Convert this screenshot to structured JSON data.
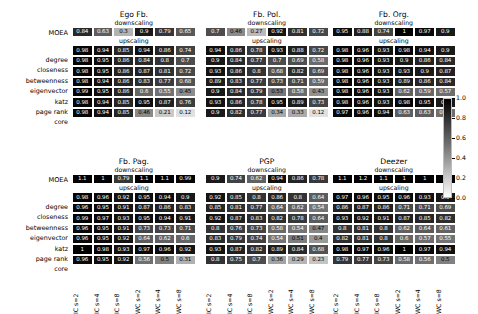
{
  "figure": {
    "cell_labels": {
      "downscaling": "downscaling",
      "upscaling": "upscaling",
      "moea_row_label": "MOEA"
    },
    "row_labels": [
      "degree",
      "closeness",
      "betweenness",
      "eigenvector",
      "katz",
      "page rank",
      "core"
    ],
    "column_labels": [
      "IC s=2",
      "IC s=4",
      "IC s=8",
      "WC s=2",
      "WC s=4",
      "WC s=8"
    ],
    "colorbar": {
      "ticks": [
        "1.0",
        "0.8",
        "0.6",
        "0.4",
        "0.2",
        "0.0"
      ],
      "vmin": 0.0,
      "vmax": 1.0,
      "colormap": "greys_reversed",
      "high_color": "#000000",
      "low_color": "#ffffff"
    }
  },
  "chart_data": {
    "type": "heatmap",
    "title": "",
    "xlabel": "",
    "ylabel": "",
    "colorbar_range": [
      0.0,
      1.0
    ],
    "x_categories": [
      "IC s=2",
      "IC s=4",
      "IC s=8",
      "WC s=2",
      "WC s=4",
      "WC s=8"
    ],
    "y_categories_main": [
      "degree",
      "closeness",
      "betweenness",
      "eigenvector",
      "katz",
      "page rank",
      "core"
    ],
    "y_categories_moea": [
      "MOEA"
    ],
    "panels": [
      {
        "name": "Ego Fb.",
        "row": 0,
        "col": 0,
        "downscaling_label": "downscaling",
        "upscaling_label": "upscaling",
        "moea": [
          0.84,
          0.63,
          0.3,
          0.9,
          0.79,
          0.65
        ],
        "values": [
          [
            0.98,
            0.94,
            0.85,
            0.94,
            0.86,
            0.74
          ],
          [
            0.98,
            0.95,
            0.86,
            0.84,
            0.8,
            0.7
          ],
          [
            0.98,
            0.95,
            0.86,
            0.87,
            0.81,
            0.72
          ],
          [
            0.98,
            0.94,
            0.86,
            0.83,
            0.77,
            0.68
          ],
          [
            0.99,
            0.95,
            0.86,
            0.6,
            0.55,
            0.45
          ],
          [
            0.98,
            0.94,
            0.85,
            0.95,
            0.87,
            0.76
          ],
          [
            0.98,
            0.94,
            0.85,
            0.46,
            0.21,
            0.12
          ]
        ]
      },
      {
        "name": "Fb. Pol.",
        "row": 0,
        "col": 1,
        "downscaling_label": "downscaling",
        "upscaling_label": "upscaling",
        "moea": [
          0.7,
          0.46,
          0.27,
          0.92,
          0.81,
          0.72
        ],
        "values": [
          [
            0.94,
            0.86,
            0.78,
            0.93,
            0.88,
            0.72
          ],
          [
            0.9,
            0.84,
            0.77,
            0.7,
            0.69,
            0.58
          ],
          [
            0.93,
            0.86,
            0.8,
            0.68,
            0.82,
            0.69
          ],
          [
            0.89,
            0.83,
            0.77,
            0.73,
            0.71,
            0.59
          ],
          [
            0.9,
            0.84,
            0.79,
            0.53,
            0.58,
            0.43
          ],
          [
            0.93,
            0.86,
            0.78,
            0.95,
            0.89,
            0.73
          ],
          [
            0.9,
            0.82,
            0.77,
            0.34,
            0.33,
            0.12
          ]
        ]
      },
      {
        "name": "Fb. Org.",
        "row": 0,
        "col": 2,
        "downscaling_label": "downscaling",
        "upscaling_label": "upscaling",
        "moea": [
          0.95,
          0.88,
          0.74,
          1.0,
          0.97,
          0.9
        ],
        "values": [
          [
            0.98,
            0.96,
            0.93,
            0.98,
            0.94,
            0.9
          ],
          [
            0.98,
            0.96,
            0.93,
            0.9,
            0.86,
            0.84
          ],
          [
            0.98,
            0.96,
            0.93,
            0.93,
            0.9,
            0.87
          ],
          [
            0.98,
            0.96,
            0.93,
            0.89,
            0.86,
            0.84
          ],
          [
            0.98,
            0.96,
            0.93,
            0.62,
            0.59,
            0.57
          ],
          [
            0.98,
            0.96,
            0.93,
            0.98,
            0.95,
            0.9
          ],
          [
            0.97,
            0.96,
            0.94,
            0.63,
            0.63,
            0.56
          ]
        ]
      },
      {
        "name": "Fb. Pag.",
        "row": 1,
        "col": 0,
        "downscaling_label": "downscaling",
        "upscaling_label": "upscaling",
        "moea": [
          1.1,
          1.0,
          0.79,
          1.1,
          1.1,
          0.99
        ],
        "values": [
          [
            0.98,
            0.96,
            0.92,
            0.95,
            0.94,
            0.9
          ],
          [
            0.96,
            0.95,
            0.91,
            0.87,
            0.86,
            0.83
          ],
          [
            0.99,
            0.97,
            0.93,
            0.95,
            0.94,
            0.91
          ],
          [
            0.96,
            0.95,
            0.91,
            0.73,
            0.73,
            0.71
          ],
          [
            0.96,
            0.95,
            0.92,
            0.64,
            0.62,
            0.6
          ],
          [
            1.0,
            0.98,
            0.93,
            0.97,
            0.96,
            0.92
          ],
          [
            0.96,
            0.95,
            0.92,
            0.56,
            0.5,
            0.31
          ]
        ]
      },
      {
        "name": "PGP",
        "row": 1,
        "col": 1,
        "downscaling_label": "downscaling",
        "upscaling_label": "upscaling",
        "moea": [
          0.9,
          0.74,
          0.62,
          0.94,
          0.86,
          0.78
        ],
        "values": [
          [
            0.92,
            0.85,
            0.8,
            0.86,
            0.8,
            0.64
          ],
          [
            0.85,
            0.81,
            0.77,
            0.64,
            0.62,
            0.54
          ],
          [
            0.92,
            0.87,
            0.83,
            0.82,
            0.78,
            0.64
          ],
          [
            0.8,
            0.76,
            0.73,
            0.58,
            0.54,
            0.47
          ],
          [
            0.83,
            0.79,
            0.74,
            0.54,
            0.51,
            0.4
          ],
          [
            0.93,
            0.87,
            0.82,
            0.89,
            0.84,
            0.68
          ],
          [
            0.8,
            0.75,
            0.7,
            0.36,
            0.29,
            0.23
          ]
        ]
      },
      {
        "name": "Deezer",
        "row": 1,
        "col": 2,
        "downscaling_label": "downscaling",
        "upscaling_label": "upscaling",
        "moea": [
          1.1,
          1.2,
          1.1,
          1.0,
          1.0,
          1.0
        ],
        "values": [
          [
            0.97,
            0.96,
            0.95,
            0.96,
            0.93,
            0.9
          ],
          [
            0.86,
            0.87,
            0.86,
            0.71,
            0.71,
            0.69
          ],
          [
            0.93,
            0.92,
            0.91,
            0.87,
            0.85,
            0.82
          ],
          [
            0.8,
            0.81,
            0.8,
            0.62,
            0.64,
            0.61
          ],
          [
            0.82,
            0.81,
            0.8,
            0.6,
            0.57,
            0.55
          ],
          [
            0.98,
            0.97,
            0.96,
            1.0,
            0.97,
            0.94
          ],
          [
            0.79,
            0.77,
            0.73,
            0.58,
            0.56,
            0.5
          ]
        ]
      }
    ]
  }
}
